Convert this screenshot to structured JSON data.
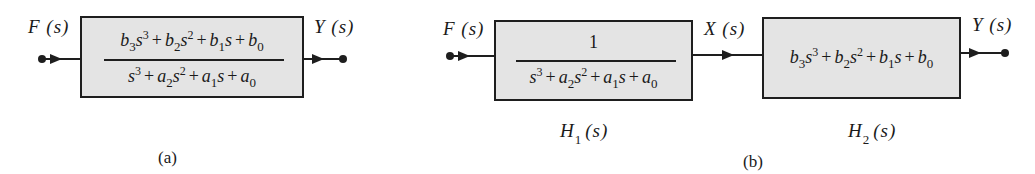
{
  "diagram_a": {
    "input_label": "F (s)",
    "output_label": "Y (s)",
    "block": {
      "numerator": [
        "b",
        "3",
        "s",
        "3",
        "+",
        "b",
        "2",
        "s",
        "2",
        "+",
        "b",
        "1",
        "s",
        "+",
        "b",
        "0"
      ],
      "numerator_text": "b3s^3 + b2s^2 + b1s + b0",
      "denominator_text": "s^3 + a2s^2 + a1s + a0"
    },
    "caption": "(a)"
  },
  "diagram_b": {
    "input_label": "F (s)",
    "middle_label": "X (s)",
    "output_label": "Y (s)",
    "block1": {
      "numerator_text": "1",
      "denominator_text": "s^3 + a2s^2 + a1s + a0",
      "name": "H",
      "name_sub": "1",
      "name_arg": "(s)"
    },
    "block2": {
      "expression_text": "b3s^3 + b2s^2 + b1s + b0",
      "name": "H",
      "name_sub": "2",
      "name_arg": "(s)"
    },
    "caption": "(b)"
  },
  "math": {
    "b": "b",
    "s": "s",
    "a": "a",
    "plus": "+",
    "one": "1",
    "i0": "0",
    "i1": "1",
    "i2": "2",
    "i3": "3"
  },
  "colors": {
    "block_fill": "#e4e4e4",
    "stroke": "#1e1e1e",
    "background": "#ffffff"
  }
}
